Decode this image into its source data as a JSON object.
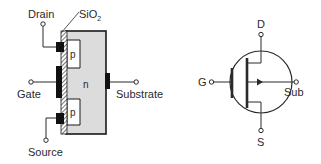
{
  "cross_section": {
    "labels": {
      "drain": "Drain",
      "oxide_main": "SiO",
      "oxide_sub": "2",
      "gate": "Gate",
      "substrate": "Substrate",
      "source": "Source",
      "p_top": "p",
      "n_body": "n",
      "p_bottom": "p"
    },
    "colors": {
      "body_fill": "#dcdcdc",
      "p_region_fill": "#ffffff",
      "metal": "#111111",
      "line": "#2a2a2a"
    }
  },
  "symbol": {
    "labels": {
      "drain": "D",
      "gate": "G",
      "source": "S",
      "substrate": "Sub"
    }
  }
}
